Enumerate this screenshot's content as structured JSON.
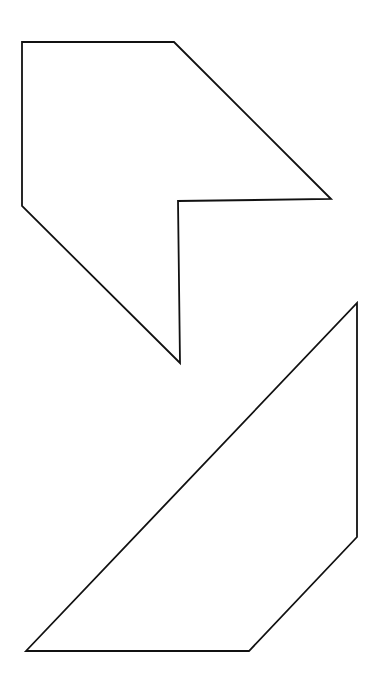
{
  "canvas": {
    "width": 384,
    "height": 698,
    "background": "#ffffff",
    "stroke": "#111111"
  },
  "shapes": [
    {
      "name": "upper-notched-polygon",
      "points": "22,42 174,42 331,199 178,201 180,363 22,206"
    },
    {
      "name": "lower-trapezoid",
      "points": "357,303 357,537 249,651 26,651"
    }
  ]
}
